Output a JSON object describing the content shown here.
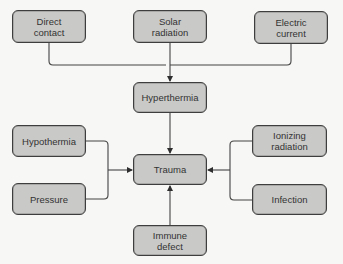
{
  "diagram": {
    "nodes": {
      "direct_contact": "Direct\ncontact",
      "solar_radiation": "Solar\nradiation",
      "electric_current": "Electric\ncurrent",
      "hyperthermia": "Hyperthermia",
      "hypothermia": "Hypothermia",
      "pressure": "Pressure",
      "trauma": "Trauma",
      "ionizing_radiation": "Ionizing\nradiation",
      "infection": "Infection",
      "immune_defect": "Immune\ndefect"
    },
    "edges": [
      {
        "from": "direct_contact",
        "to": "hyperthermia"
      },
      {
        "from": "solar_radiation",
        "to": "hyperthermia"
      },
      {
        "from": "electric_current",
        "to": "hyperthermia"
      },
      {
        "from": "hyperthermia",
        "to": "trauma"
      },
      {
        "from": "hypothermia",
        "to": "trauma"
      },
      {
        "from": "pressure",
        "to": "trauma"
      },
      {
        "from": "ionizing_radiation",
        "to": "trauma"
      },
      {
        "from": "infection",
        "to": "trauma"
      },
      {
        "from": "immune_defect",
        "to": "trauma"
      }
    ],
    "colors": {
      "node_fill": "#c9c9c7",
      "node_border": "#3e3e3e",
      "line": "#3e3e3e",
      "background": "#f7f7f5"
    }
  }
}
